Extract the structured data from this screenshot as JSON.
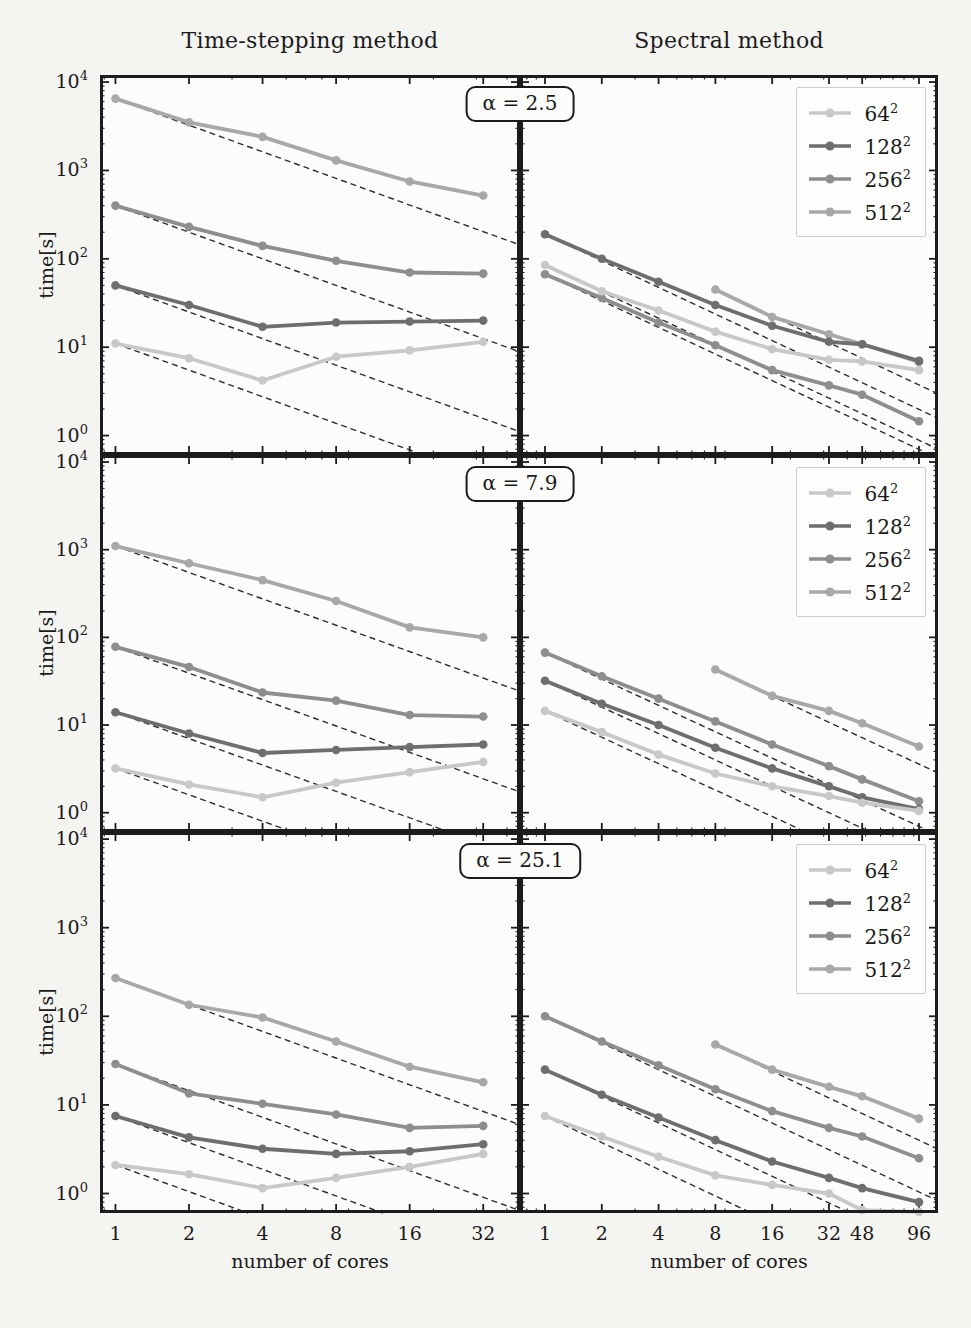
{
  "figure": {
    "column_titles": [
      "Time-stepping method",
      "Spectral method"
    ],
    "ylabel": "time[s]",
    "xlabel": "number of cores",
    "row_labels": [
      "α = 2.5",
      "α = 7.9",
      "α = 25.1"
    ],
    "y_tick_exponents": [
      4,
      3,
      2,
      1,
      0
    ],
    "colors": {
      "page_bg": "#f4f4f1",
      "plot_bg": "#fcfcfa",
      "axis": "#1c1c1c",
      "dashed_ideal": "#2f2f2f",
      "text": "#1a1a1a",
      "legend_border": "#cdcdcb",
      "series": {
        "64": "#c8c8c8",
        "128": "#6e6e6e",
        "256": "#8e8e8e",
        "512": "#a8a8a8"
      }
    },
    "legend": {
      "items": [
        {
          "label_base": "64",
          "label_exp": "2",
          "series": "64"
        },
        {
          "label_base": "128",
          "label_exp": "2",
          "series": "128"
        },
        {
          "label_base": "256",
          "label_exp": "2",
          "series": "256"
        },
        {
          "label_base": "512",
          "label_exp": "2",
          "series": "512"
        }
      ]
    }
  },
  "chart_data": [
    {
      "type": "line",
      "method": "Time-stepping method",
      "alpha": "2.5",
      "x_ticks": [
        1,
        2,
        4,
        8,
        16,
        32
      ],
      "x_range_log2": [
        -0.21,
        5.5
      ],
      "y_range_log10": [
        -0.22,
        4.08
      ],
      "show_x_labels": false,
      "show_y_labels": true,
      "legend": false,
      "ideal_scaling_dashed": true,
      "series": [
        {
          "name": "64^2",
          "color": "64",
          "x": [
            1,
            2,
            4,
            8,
            16,
            32
          ],
          "y": [
            11,
            7.5,
            4.2,
            7.8,
            9.2,
            11.5
          ]
        },
        {
          "name": "128^2",
          "color": "128",
          "x": [
            1,
            2,
            4,
            8,
            16,
            32
          ],
          "y": [
            50,
            30,
            17,
            19,
            19.5,
            20
          ]
        },
        {
          "name": "256^2",
          "color": "256",
          "x": [
            1,
            2,
            4,
            8,
            16,
            32
          ],
          "y": [
            400,
            230,
            140,
            95,
            70,
            68
          ]
        },
        {
          "name": "512^2",
          "color": "512",
          "x": [
            1,
            2,
            4,
            8,
            16,
            32
          ],
          "y": [
            6500,
            3500,
            2400,
            1300,
            750,
            520
          ]
        }
      ]
    },
    {
      "type": "line",
      "method": "Spectral method",
      "alpha": "2.5",
      "x_ticks": [
        1,
        2,
        4,
        8,
        16,
        32,
        48,
        96
      ],
      "x_range_log2": [
        -0.44,
        6.92
      ],
      "y_range_log10": [
        -0.22,
        4.08
      ],
      "show_x_labels": false,
      "show_y_labels": false,
      "legend": true,
      "ideal_scaling_dashed": true,
      "series": [
        {
          "name": "64^2",
          "color": "64",
          "x": [
            1,
            2,
            4,
            8,
            16,
            32,
            48,
            96
          ],
          "y": [
            85,
            43,
            26,
            15,
            9.5,
            7.2,
            6.9,
            5.5
          ]
        },
        {
          "name": "128^2",
          "color": "128",
          "x": [
            1,
            2,
            4,
            8,
            16,
            32,
            48,
            96
          ],
          "y": [
            190,
            100,
            55,
            30,
            17.5,
            11.5,
            10.8,
            7.0
          ]
        },
        {
          "name": "256^2",
          "color": "256",
          "x": [
            1,
            2,
            4,
            8,
            16,
            32,
            48,
            96
          ],
          "y": [
            67,
            36,
            19,
            10.5,
            5.5,
            3.7,
            2.9,
            1.45
          ]
        },
        {
          "name": "512^2",
          "color": "512",
          "x": [
            8,
            16,
            32,
            48,
            96
          ],
          "y": [
            45,
            22,
            14,
            10.8,
            6.8
          ]
        }
      ]
    },
    {
      "type": "line",
      "method": "Time-stepping method",
      "alpha": "7.9",
      "x_ticks": [
        1,
        2,
        4,
        8,
        16,
        32
      ],
      "x_range_log2": [
        -0.21,
        5.5
      ],
      "y_range_log10": [
        -0.22,
        4.08
      ],
      "show_x_labels": false,
      "show_y_labels": true,
      "legend": false,
      "ideal_scaling_dashed": true,
      "series": [
        {
          "name": "64^2",
          "color": "64",
          "x": [
            1,
            2,
            4,
            8,
            16,
            32
          ],
          "y": [
            3.2,
            2.1,
            1.5,
            2.2,
            2.9,
            3.8
          ]
        },
        {
          "name": "128^2",
          "color": "128",
          "x": [
            1,
            2,
            4,
            8,
            16,
            32
          ],
          "y": [
            14,
            8,
            4.8,
            5.2,
            5.6,
            6.0
          ]
        },
        {
          "name": "256^2",
          "color": "256",
          "x": [
            1,
            2,
            4,
            8,
            16,
            32
          ],
          "y": [
            78,
            46,
            23.5,
            19,
            13,
            12.5
          ]
        },
        {
          "name": "512^2",
          "color": "512",
          "x": [
            1,
            2,
            4,
            8,
            16,
            32
          ],
          "y": [
            1100,
            700,
            450,
            260,
            130,
            100
          ]
        }
      ]
    },
    {
      "type": "line",
      "method": "Spectral method",
      "alpha": "7.9",
      "x_ticks": [
        1,
        2,
        4,
        8,
        16,
        32,
        48,
        96
      ],
      "x_range_log2": [
        -0.44,
        6.92
      ],
      "y_range_log10": [
        -0.22,
        4.08
      ],
      "show_x_labels": false,
      "show_y_labels": false,
      "legend": true,
      "ideal_scaling_dashed": true,
      "series": [
        {
          "name": "64^2",
          "color": "64",
          "x": [
            1,
            2,
            4,
            8,
            16,
            32,
            48,
            96
          ],
          "y": [
            14.5,
            8.3,
            4.6,
            2.8,
            2.0,
            1.55,
            1.3,
            1.05
          ]
        },
        {
          "name": "128^2",
          "color": "128",
          "x": [
            1,
            2,
            4,
            8,
            16,
            32,
            48,
            96
          ],
          "y": [
            32,
            17.5,
            10,
            5.5,
            3.2,
            2.0,
            1.5,
            1.1
          ]
        },
        {
          "name": "256^2",
          "color": "256",
          "x": [
            1,
            2,
            4,
            8,
            16,
            32,
            48,
            96
          ],
          "y": [
            67,
            36,
            20,
            11,
            6.0,
            3.4,
            2.4,
            1.35
          ]
        },
        {
          "name": "512^2",
          "color": "512",
          "x": [
            8,
            16,
            32,
            48,
            96
          ],
          "y": [
            43,
            21.5,
            14.5,
            10.5,
            5.7
          ]
        }
      ]
    },
    {
      "type": "line",
      "method": "Time-stepping method",
      "alpha": "25.1",
      "x_ticks": [
        1,
        2,
        4,
        8,
        16,
        32
      ],
      "x_range_log2": [
        -0.21,
        5.5
      ],
      "y_range_log10": [
        -0.22,
        4.08
      ],
      "show_x_labels": true,
      "show_y_labels": true,
      "legend": false,
      "ideal_scaling_dashed": true,
      "series": [
        {
          "name": "64^2",
          "color": "64",
          "x": [
            1,
            2,
            4,
            8,
            16,
            32
          ],
          "y": [
            2.1,
            1.65,
            1.15,
            1.5,
            2.0,
            2.8
          ]
        },
        {
          "name": "128^2",
          "color": "128",
          "x": [
            1,
            2,
            4,
            8,
            16,
            32
          ],
          "y": [
            7.5,
            4.3,
            3.2,
            2.8,
            3.0,
            3.6
          ]
        },
        {
          "name": "256^2",
          "color": "256",
          "x": [
            1,
            2,
            4,
            8,
            16,
            32
          ],
          "y": [
            29,
            13.5,
            10.3,
            7.8,
            5.5,
            5.8
          ]
        },
        {
          "name": "512^2",
          "color": "512",
          "x": [
            1,
            2,
            4,
            8,
            16,
            32
          ],
          "y": [
            270,
            135,
            97,
            52,
            27,
            18
          ]
        }
      ]
    },
    {
      "type": "line",
      "method": "Spectral method",
      "alpha": "25.1",
      "x_ticks": [
        1,
        2,
        4,
        8,
        16,
        32,
        48,
        96
      ],
      "x_range_log2": [
        -0.44,
        6.92
      ],
      "y_range_log10": [
        -0.22,
        4.08
      ],
      "show_x_labels": true,
      "show_y_labels": false,
      "legend": true,
      "ideal_scaling_dashed": true,
      "series": [
        {
          "name": "64^2",
          "color": "64",
          "x": [
            1,
            2,
            4,
            8,
            16,
            32,
            48,
            96
          ],
          "y": [
            7.5,
            4.4,
            2.6,
            1.6,
            1.25,
            1.0,
            0.65,
            0.62
          ]
        },
        {
          "name": "128^2",
          "color": "128",
          "x": [
            1,
            2,
            4,
            8,
            16,
            32,
            48,
            96
          ],
          "y": [
            25,
            13,
            7.2,
            4.0,
            2.3,
            1.5,
            1.15,
            0.8
          ]
        },
        {
          "name": "256^2",
          "color": "256",
          "x": [
            1,
            2,
            4,
            8,
            16,
            32,
            48,
            96
          ],
          "y": [
            100,
            52,
            28,
            15,
            8.5,
            5.5,
            4.4,
            2.5
          ]
        },
        {
          "name": "512^2",
          "color": "512",
          "x": [
            8,
            16,
            32,
            48,
            96
          ],
          "y": [
            48,
            25,
            16,
            12.5,
            7.0
          ]
        }
      ]
    }
  ]
}
